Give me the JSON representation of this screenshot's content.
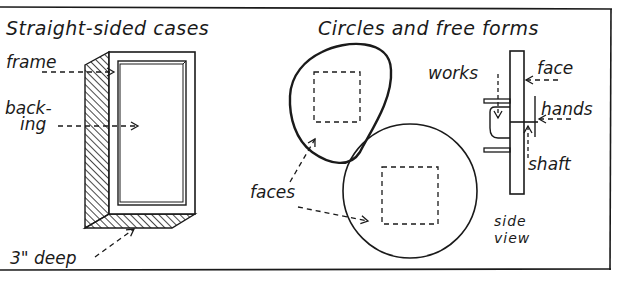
{
  "sections": {
    "left_title": "Straight-sided cases",
    "right_title": "Circles and free forms"
  },
  "labels": {
    "frame": "frame",
    "backing_1": "back-",
    "backing_2": "ing",
    "depth": "3\" deep",
    "faces": "faces",
    "works": "works",
    "face": "face",
    "hands": "hands",
    "shaft": "shaft",
    "side_1": "side",
    "side_2": "view"
  },
  "colors": {
    "ink": "#1a1a1a",
    "paper": "#ffffff"
  }
}
